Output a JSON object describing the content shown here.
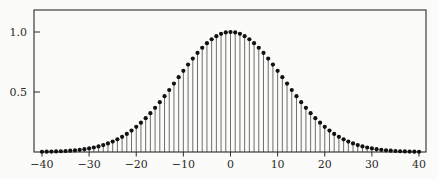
{
  "figure": {
    "background_color": "#fbfbf9",
    "axis_color": "#2b2b2b",
    "stem_color": "#4a4a4a",
    "marker_color": "#111111",
    "label_color": "#2b2b2b"
  },
  "chart_data": {
    "type": "stem",
    "title": "",
    "xlabel": "",
    "ylabel": "",
    "x_start": -40,
    "x_step": 1,
    "x": [
      -40,
      -39,
      -38,
      -37,
      -36,
      -35,
      -34,
      -33,
      -32,
      -31,
      -30,
      -29,
      -28,
      -27,
      -26,
      -25,
      -24,
      -23,
      -22,
      -21,
      -20,
      -19,
      -18,
      -17,
      -16,
      -15,
      -14,
      -13,
      -12,
      -11,
      -10,
      -9,
      -8,
      -7,
      -6,
      -5,
      -4,
      -3,
      -2,
      -1,
      0,
      1,
      2,
      3,
      4,
      5,
      6,
      7,
      8,
      9,
      10,
      11,
      12,
      13,
      14,
      15,
      16,
      17,
      18,
      19,
      20,
      21,
      22,
      23,
      24,
      25,
      26,
      27,
      28,
      29,
      30,
      31,
      32,
      33,
      34,
      35,
      36,
      37,
      38,
      39,
      40
    ],
    "values": [
      0.0019,
      0.0026,
      0.0036,
      0.0048,
      0.0063,
      0.0083,
      0.0109,
      0.0142,
      0.0183,
      0.0234,
      0.0297,
      0.0374,
      0.0468,
      0.058,
      0.0714,
      0.087,
      0.1054,
      0.1267,
      0.151,
      0.1786,
      0.2096,
      0.2441,
      0.2821,
      0.3234,
      0.3679,
      0.4152,
      0.4651,
      0.5168,
      0.5698,
      0.6234,
      0.6767,
      0.7288,
      0.7788,
      0.8258,
      0.8688,
      0.907,
      0.9394,
      0.9655,
      0.9845,
      0.9961,
      1.0,
      0.9961,
      0.9845,
      0.9655,
      0.9394,
      0.907,
      0.8688,
      0.8258,
      0.7788,
      0.7288,
      0.6767,
      0.6234,
      0.5698,
      0.5168,
      0.4651,
      0.4152,
      0.3679,
      0.3234,
      0.2821,
      0.2441,
      0.2096,
      0.1786,
      0.151,
      0.1267,
      0.1054,
      0.087,
      0.0714,
      0.058,
      0.0468,
      0.0374,
      0.0297,
      0.0234,
      0.0183,
      0.0142,
      0.0109,
      0.0083,
      0.0063,
      0.0048,
      0.0036,
      0.0026,
      0.0019
    ],
    "xticks": [
      -40,
      -30,
      -20,
      -10,
      0,
      10,
      20,
      30,
      40
    ],
    "xtick_labels": [
      "−40",
      "−30",
      "−20",
      "−10",
      "0",
      "10",
      "20",
      "30",
      "40"
    ],
    "yticks": [
      0.5,
      1.0
    ],
    "ytick_labels": [
      "0.5",
      "1.0"
    ],
    "xlim": [
      -41.7,
      41.5
    ],
    "ylim": [
      0,
      1.18
    ],
    "grid": false,
    "legend": "none"
  }
}
